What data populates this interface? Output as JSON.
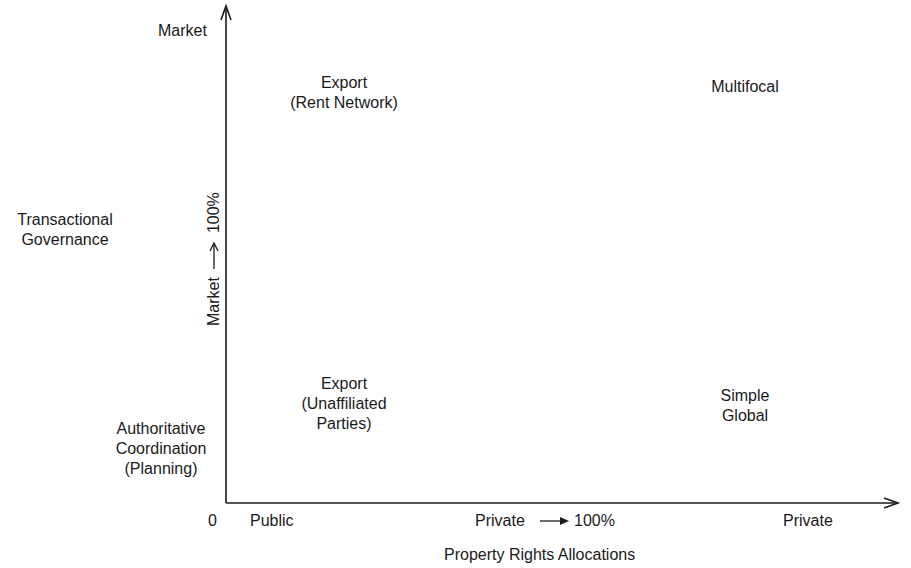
{
  "diagram": {
    "title": "",
    "y_axis": {
      "top_label": "Market",
      "middle_label": [
        "Transactional",
        "Governance"
      ],
      "bottom_label": [
        "Authoritative",
        "Coordination",
        "(Planning)"
      ],
      "rotated_label_left": "Market",
      "rotated_label_right": "100%"
    },
    "x_axis": {
      "origin": "0",
      "left_label": "Public",
      "middle_label_left": "Private",
      "middle_label_right": "100%",
      "right_label": "Private",
      "title": "Property Rights Allocations"
    },
    "quadrants": {
      "top_left": [
        "Export",
        "(Rent Network)"
      ],
      "top_right": [
        "Multifocal"
      ],
      "bottom_left": [
        "Export",
        "(Unaffiliated",
        "Parties)"
      ],
      "bottom_right": [
        "Simple",
        "Global"
      ]
    },
    "colors": {
      "ink": "#1a1a1a",
      "background": "#ffffff"
    }
  }
}
